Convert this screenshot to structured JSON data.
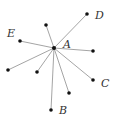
{
  "diagram": {
    "center": {
      "label": "A",
      "x": 54,
      "y": 48,
      "label_x": 63,
      "label_y": 48
    },
    "line_color": "#9a9a9a",
    "point_color": "#111111",
    "points": [
      {
        "label": "D",
        "x": 87,
        "y": 14,
        "label_x": 95,
        "label_y": 19
      },
      {
        "label": "",
        "x": 46,
        "y": 25
      },
      {
        "label": "E",
        "x": 20,
        "y": 41,
        "label_x": 7,
        "label_y": 37
      },
      {
        "label": "",
        "x": 93,
        "y": 51
      },
      {
        "label": "",
        "x": 8,
        "y": 70
      },
      {
        "label": "",
        "x": 37,
        "y": 72
      },
      {
        "label": "C",
        "x": 93,
        "y": 80,
        "label_x": 101,
        "label_y": 87
      },
      {
        "label": "",
        "x": 69,
        "y": 93
      },
      {
        "label": "B",
        "x": 51,
        "y": 110,
        "label_x": 59,
        "label_y": 114
      }
    ]
  }
}
